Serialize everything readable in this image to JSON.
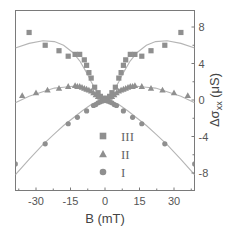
{
  "chart_data": {
    "type": "scatter",
    "title": "",
    "xlabel": "B (mT)",
    "ylabel": "Δσxx (μS)",
    "ylabel_parts": {
      "main": "Δσ",
      "sub": "xx",
      "unit": " (μS)"
    },
    "xlim": [
      -39,
      39
    ],
    "ylim": [
      -10,
      10
    ],
    "x_ticks": [
      -30,
      -15,
      0,
      15,
      30
    ],
    "y_ticks": [
      8,
      4,
      0,
      -4,
      -8
    ],
    "y_axis_position": "right",
    "grid": false,
    "legend_position": "lower center",
    "colors": {
      "marker": "#8f8f8f",
      "fit": "#b5b5b5",
      "axis": "#7a7a7a"
    },
    "series": [
      {
        "name": "III",
        "marker": "square",
        "x": [
          -33,
          -26,
          -20,
          -16,
          -13,
          -11,
          -9,
          -8,
          -7,
          -6,
          -4.5,
          -3,
          -2,
          -1,
          0,
          1,
          2,
          3,
          4.5,
          6,
          7,
          8,
          9,
          11,
          13,
          16,
          20,
          26,
          33
        ],
        "y": [
          7.4,
          6.0,
          5.4,
          4.8,
          5.0,
          5.0,
          4.4,
          3.8,
          3.0,
          2.4,
          1.4,
          0.8,
          0.4,
          0.2,
          0.0,
          0.2,
          0.4,
          0.8,
          1.4,
          2.4,
          3.0,
          3.8,
          4.4,
          5.0,
          5.0,
          4.8,
          5.4,
          6.0,
          7.4
        ]
      },
      {
        "name": "II",
        "marker": "triangle",
        "x": [
          -36,
          -30,
          -25,
          -20,
          -16,
          -13,
          -12,
          -11,
          -10,
          -9,
          -8,
          -7,
          -6,
          -5,
          -4,
          -3,
          -2,
          -1,
          0,
          1,
          2,
          3,
          4,
          5,
          6,
          7,
          8,
          9,
          10,
          11,
          12,
          13,
          16,
          20,
          25,
          30,
          36
        ],
        "y": [
          0.5,
          0.8,
          1.1,
          1.3,
          1.5,
          1.6,
          1.5,
          1.5,
          1.4,
          1.3,
          1.2,
          1.1,
          1.0,
          0.8,
          0.6,
          0.4,
          0.3,
          0.1,
          0.0,
          0.1,
          0.3,
          0.4,
          0.6,
          0.8,
          1.0,
          1.1,
          1.2,
          1.3,
          1.4,
          1.5,
          1.5,
          1.6,
          1.5,
          1.3,
          1.1,
          0.8,
          0.5
        ]
      },
      {
        "name": "I",
        "marker": "circle",
        "x": [
          -39,
          -26,
          -16,
          -12,
          -8,
          -5,
          -4,
          -3,
          -2,
          -1,
          0,
          1,
          2,
          3,
          4,
          5,
          8,
          12,
          16,
          26,
          39
        ],
        "y": [
          -7.0,
          -4.8,
          -2.6,
          -1.9,
          -1.2,
          -0.6,
          -0.5,
          -0.3,
          -0.2,
          -0.1,
          0.0,
          -0.1,
          -0.2,
          -0.3,
          -0.5,
          -0.6,
          -1.2,
          -1.9,
          -2.6,
          -4.8,
          -7.0
        ]
      }
    ],
    "fits": [
      {
        "name": "III fit",
        "x": [
          -39,
          -33,
          -27,
          -22,
          -18,
          -14,
          -11,
          -8,
          -6,
          -4,
          -2,
          0,
          2,
          4,
          6,
          8,
          11,
          14,
          18,
          22,
          27,
          33,
          39
        ],
        "y": [
          5.7,
          6.2,
          6.5,
          6.4,
          6.0,
          5.2,
          4.3,
          3.0,
          2.0,
          1.1,
          0.3,
          0.0,
          0.3,
          1.1,
          2.0,
          3.0,
          4.3,
          5.2,
          6.0,
          6.4,
          6.5,
          6.2,
          5.7
        ]
      },
      {
        "name": "II fit",
        "x": [
          -39,
          -33,
          -27,
          -22,
          -18,
          -14,
          -11,
          -8,
          -6,
          -4,
          -2,
          0,
          2,
          4,
          6,
          8,
          11,
          14,
          18,
          22,
          27,
          33,
          39
        ],
        "y": [
          -0.3,
          0.4,
          0.9,
          1.3,
          1.4,
          1.5,
          1.4,
          1.2,
          0.9,
          0.6,
          0.2,
          0.0,
          0.2,
          0.6,
          0.9,
          1.2,
          1.4,
          1.5,
          1.4,
          1.3,
          0.9,
          0.4,
          -0.3
        ]
      },
      {
        "name": "I fit",
        "x": [
          -39,
          -33,
          -27,
          -22,
          -18,
          -14,
          -10,
          -6,
          -3,
          0,
          3,
          6,
          10,
          14,
          18,
          22,
          27,
          33,
          39
        ],
        "y": [
          -8.2,
          -6.5,
          -4.9,
          -3.7,
          -2.8,
          -2.0,
          -1.2,
          -0.5,
          -0.15,
          0.0,
          -0.15,
          -0.5,
          -1.2,
          -2.0,
          -2.8,
          -3.7,
          -4.9,
          -6.5,
          -8.2
        ]
      }
    ],
    "legend": [
      {
        "label": "III",
        "marker": "square"
      },
      {
        "label": "II",
        "marker": "triangle"
      },
      {
        "label": "I",
        "marker": "circle"
      }
    ]
  }
}
